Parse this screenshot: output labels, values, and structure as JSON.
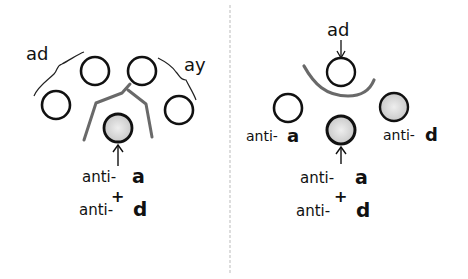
{
  "left_panel": {
    "labels": {
      "group_left": "ad",
      "group_right": "ay",
      "antibody_line1_prefix": "anti-",
      "antibody_line1_letter": "a",
      "plus": "+",
      "antibody_line2_prefix": "anti-",
      "antibody_line2_letter": "d"
    },
    "circles": [
      {
        "id": "outer-left",
        "cx": 56,
        "cy": 105,
        "r": 14,
        "shaded": false
      },
      {
        "id": "upper-left",
        "cx": 95,
        "cy": 71,
        "r": 14,
        "shaded": false
      },
      {
        "id": "upper-right",
        "cx": 142,
        "cy": 71,
        "r": 14,
        "shaded": false
      },
      {
        "id": "outer-right",
        "cx": 179,
        "cy": 110,
        "r": 14,
        "shaded": false
      },
      {
        "id": "center-target",
        "cx": 118,
        "cy": 128,
        "r": 14,
        "shaded": true
      }
    ]
  },
  "right_panel": {
    "labels": {
      "top": "ad",
      "left_circle_prefix": "anti-",
      "left_circle_letter": "a",
      "right_circle_prefix": "anti-",
      "right_circle_letter": "d",
      "antibody_line1_prefix": "anti-",
      "antibody_line1_letter": "a",
      "plus": "+",
      "antibody_line2_prefix": "anti-",
      "antibody_line2_letter": "d"
    },
    "circles": [
      {
        "id": "top-ad",
        "cx": 341,
        "cy": 72,
        "r": 14,
        "shaded": false
      },
      {
        "id": "left-anti-a",
        "cx": 288,
        "cy": 108,
        "r": 14,
        "shaded": false
      },
      {
        "id": "right-anti-d",
        "cx": 394,
        "cy": 107,
        "r": 14,
        "shaded": true
      },
      {
        "id": "center-target",
        "cx": 341,
        "cy": 130,
        "r": 14,
        "shaded": true
      }
    ]
  },
  "colors": {
    "ink": "#111111",
    "shade": "#d8d8d8",
    "pencil": "#555555",
    "divider": "#bbbbbb"
  }
}
